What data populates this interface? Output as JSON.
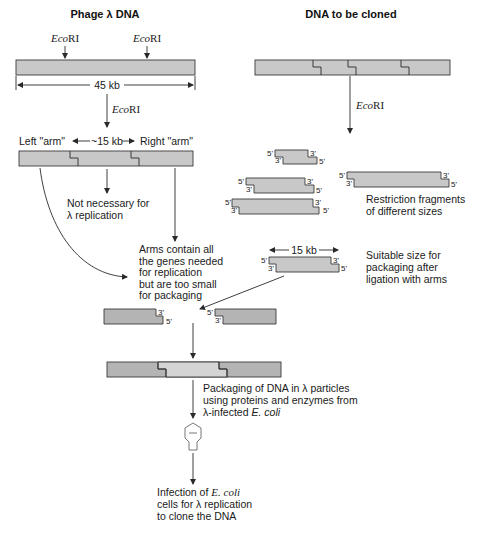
{
  "titles": {
    "left": "Phage λ DNA",
    "right": "DNA to be cloned"
  },
  "enzyme": {
    "name_italic": "Eco",
    "name_roman": "RI"
  },
  "lambda": {
    "length_label": "45 kb",
    "left_arm": "Left \"arm\"",
    "middle_length": "~15 kb",
    "right_arm": "Right \"arm\"",
    "not_necessary": [
      "Not necessary for",
      "λ replication"
    ],
    "arms_note": [
      "Arms contain all",
      "the genes needed",
      "for replication",
      "but are too small",
      "for packaging"
    ]
  },
  "fragments": {
    "ends": {
      "five_prime": "5'",
      "three_prime": "3'"
    },
    "note": [
      "Restriction fragments",
      "of different sizes"
    ],
    "suitable_length": "15 kb",
    "suitable_note": [
      "Suitable size for",
      "packaging after",
      "ligation with arms"
    ]
  },
  "packaging": {
    "note_line1": "Packaging of DNA in λ particles",
    "note_line2": "using proteins and enzymes from",
    "note_line3_prefix": "λ-infected ",
    "note_line3_italic": "E. coli"
  },
  "infection": {
    "line1_prefix": "Infection of ",
    "line1_italic": "E. coli",
    "line2": "cells for λ replication",
    "line3": "to clone the DNA"
  }
}
